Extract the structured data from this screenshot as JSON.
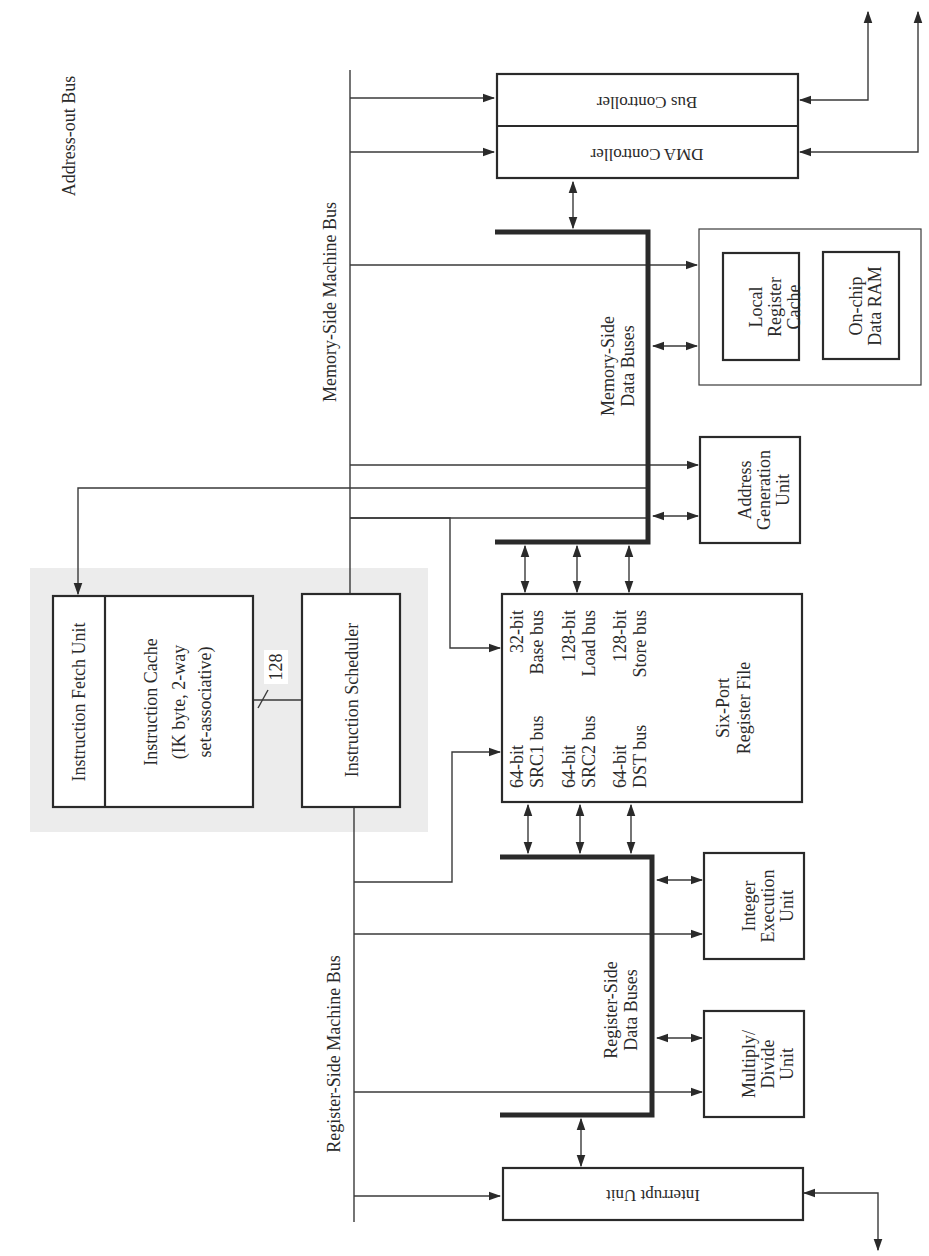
{
  "diagram": {
    "orientation": "rotated 90 degrees counter-clockwise (text reads bottom-to-top)",
    "bus_labels": {
      "address_out_bus": "Address-out Bus",
      "memory_side_machine_bus": "Memory-Side Machine Bus",
      "register_side_machine_bus": "Register-Side Machine Bus",
      "memory_side_data_buses": [
        "Memory-Side",
        "Data Buses"
      ],
      "register_side_data_buses": [
        "Register-Side",
        "Data Buses"
      ],
      "instruction_bus_width": "128"
    },
    "blocks": {
      "instruction_fetch_unit": "Instruction Fetch Unit",
      "instruction_cache": [
        "Instruction Cache",
        "(IK byte, 2-way",
        "set-associative)"
      ],
      "instruction_scheduler": "Instruction Scheduler",
      "register_file": {
        "title": [
          "Six-Port",
          "Register File"
        ],
        "ports": [
          {
            "width": "64-bit",
            "name": "SRC1 bus"
          },
          {
            "width": "64-bit",
            "name": "SRC2 bus"
          },
          {
            "width": "64-bit",
            "name": "DST bus"
          },
          {
            "width": "32-bit",
            "name": "Base bus"
          },
          {
            "width": "128-bit",
            "name": "Load bus"
          },
          {
            "width": "128-bit",
            "name": "Store bus"
          }
        ]
      },
      "bus_controller": "Bus Controller",
      "dma_controller": "DMA Controller",
      "local_register_cache": [
        "Local",
        "Register",
        "Cache"
      ],
      "on_chip_data_ram": [
        "On-chip",
        "Data RAM"
      ],
      "address_generation_unit": [
        "Address",
        "Generation",
        "Unit"
      ],
      "integer_execution_unit": [
        "Integer",
        "Execution",
        "Unit"
      ],
      "multiply_divide_unit": [
        "Multiply/",
        "Divide",
        "Unit"
      ],
      "interrupt_unit": "Interrupt Unit"
    },
    "colors": {
      "line": "#3a3a3a",
      "text": "#2a2a2a",
      "shaded_region": "#ececec",
      "background": "#ffffff"
    }
  }
}
